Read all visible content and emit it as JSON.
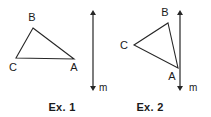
{
  "figure": {
    "background_color": "#ffffff",
    "stroke_color": "#262626",
    "text_color": "#1a1a1a",
    "width": 211,
    "height": 117
  },
  "examples": [
    {
      "caption": "Ex. 1",
      "caption_pos": {
        "x": 62,
        "y": 111
      },
      "triangle": {
        "name": "triangle-abc",
        "vertices": [
          {
            "label": "A",
            "x": 74,
            "y": 59,
            "label_x": 74,
            "label_y": 71
          },
          {
            "label": "B",
            "x": 33,
            "y": 28,
            "label_x": 32,
            "label_y": 21
          },
          {
            "label": "C",
            "x": 16,
            "y": 58,
            "label_x": 13,
            "label_y": 71
          }
        ],
        "path": "M 33 28 L 74 59 L 16 58 Z"
      },
      "line": {
        "label": "m",
        "label_x": 99,
        "label_y": 91,
        "x": 93,
        "y_top": 10,
        "y_bottom": 91
      }
    },
    {
      "caption": "Ex. 2",
      "caption_pos": {
        "x": 150,
        "y": 111
      },
      "triangle": {
        "name": "triangle-abc",
        "vertices": [
          {
            "label": "A",
            "x": 178,
            "y": 68,
            "label_x": 172,
            "label_y": 80
          },
          {
            "label": "B",
            "x": 168,
            "y": 23,
            "label_x": 165,
            "label_y": 16
          },
          {
            "label": "C",
            "x": 134,
            "y": 45,
            "label_x": 124,
            "label_y": 49
          }
        ],
        "path": "M 168 23 L 178 68 L 134 45 Z"
      },
      "line": {
        "label": "m",
        "label_x": 189,
        "label_y": 91,
        "x": 180,
        "y_top": 10,
        "y_bottom": 91
      }
    }
  ]
}
